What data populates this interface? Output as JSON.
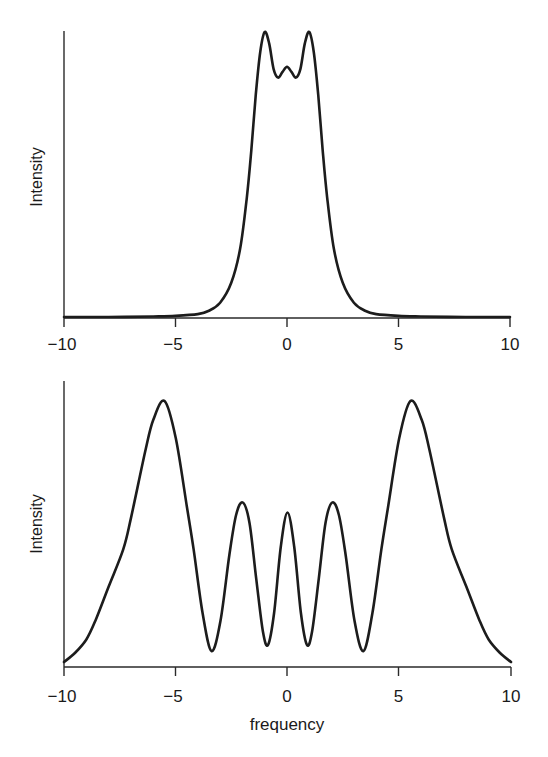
{
  "chart_data": [
    {
      "type": "line",
      "title": "",
      "xlabel": "",
      "ylabel": "Intensity",
      "xlim": [
        -10,
        10
      ],
      "ylim": [
        0,
        1
      ],
      "xticks": [
        -10,
        -5,
        0,
        5,
        10
      ],
      "xtick_labels": [
        "−10",
        "−5",
        "0",
        "5",
        "10"
      ],
      "grid": false,
      "legend": null,
      "description": "Symmetric spectrum with two main peaks at about ±1 and a small central bump at 0",
      "series": [
        {
          "name": "intensity",
          "x": [
            -10,
            -8,
            -6,
            -5,
            -4,
            -3.5,
            -3,
            -2.5,
            -2.1,
            -1.8,
            -1.6,
            -1.4,
            -1.2,
            -1.0,
            -0.8,
            -0.6,
            -0.4,
            -0.2,
            0,
            0.2,
            0.4,
            0.6,
            0.8,
            1.0,
            1.2,
            1.4,
            1.6,
            1.8,
            2.1,
            2.5,
            3,
            3.5,
            4,
            5,
            6,
            8,
            10
          ],
          "y": [
            0.0,
            0.0,
            0.002,
            0.004,
            0.01,
            0.022,
            0.05,
            0.12,
            0.24,
            0.42,
            0.585,
            0.78,
            0.93,
            1.0,
            0.96,
            0.87,
            0.84,
            0.86,
            0.878,
            0.86,
            0.84,
            0.87,
            0.96,
            1.0,
            0.93,
            0.78,
            0.585,
            0.42,
            0.24,
            0.12,
            0.05,
            0.022,
            0.01,
            0.004,
            0.002,
            0.0,
            0.0
          ]
        }
      ]
    },
    {
      "type": "line",
      "title": "",
      "xlabel": "frequency",
      "ylabel": "Intensity",
      "xlim": [
        -10,
        10
      ],
      "ylim": [
        0,
        1
      ],
      "xticks": [
        -10,
        -5,
        0,
        5,
        10
      ],
      "xtick_labels": [
        "−10",
        "−5",
        "0",
        "5",
        "10"
      ],
      "grid": false,
      "legend": null,
      "description": "Symmetric spectrum with large peaks at about ±5.5, medium peaks at ±2 and a central peak at 0",
      "series": [
        {
          "name": "intensity",
          "x": [
            -10,
            -9.5,
            -9,
            -8.6,
            -8,
            -7.35,
            -7,
            -6.35,
            -6,
            -5.5,
            -5,
            -4.5,
            -4.2,
            -3.8,
            -3.4,
            -3.0,
            -2.6,
            -2.3,
            -2.0,
            -1.7,
            -1.4,
            -1.1,
            -0.87,
            -0.6,
            -0.3,
            0,
            0.3,
            0.6,
            0.87,
            1.1,
            1.4,
            1.7,
            2.0,
            2.3,
            2.6,
            3.0,
            3.4,
            3.8,
            4.2,
            4.5,
            5,
            5.5,
            6,
            6.35,
            7,
            7.35,
            8,
            8.6,
            9,
            9.5,
            10
          ],
          "y": [
            0.015,
            0.05,
            0.1,
            0.17,
            0.3,
            0.44,
            0.56,
            0.816,
            0.93,
            1.0,
            0.86,
            0.6,
            0.44,
            0.2,
            0.056,
            0.17,
            0.42,
            0.57,
            0.617,
            0.54,
            0.33,
            0.13,
            0.08,
            0.2,
            0.45,
            0.579,
            0.45,
            0.2,
            0.08,
            0.13,
            0.33,
            0.54,
            0.617,
            0.57,
            0.42,
            0.17,
            0.056,
            0.2,
            0.44,
            0.6,
            0.86,
            1.0,
            0.93,
            0.816,
            0.56,
            0.44,
            0.3,
            0.17,
            0.1,
            0.05,
            0.015
          ]
        }
      ]
    }
  ],
  "panels": {
    "top": {
      "ylabel": "Intensity",
      "ticks": [
        "−10",
        "−5",
        "0",
        "5",
        "10"
      ]
    },
    "bottom": {
      "ylabel": "Intensity",
      "xlabel": "frequency",
      "ticks": [
        "−10",
        "−5",
        "0",
        "5",
        "10"
      ]
    }
  }
}
